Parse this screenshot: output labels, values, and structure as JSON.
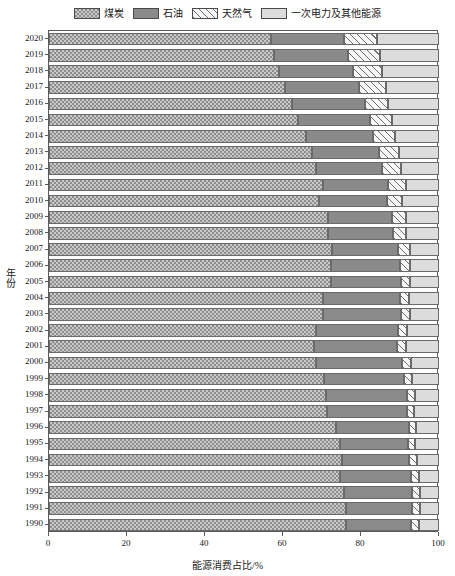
{
  "chart_data": {
    "type": "bar",
    "orientation": "horizontal",
    "stacked": true,
    "stack_total": 100,
    "title": "",
    "xlabel": "能源消费占比/%",
    "ylabel": "年份",
    "xlim": [
      0,
      100
    ],
    "xticks": [
      0,
      20,
      40,
      60,
      80,
      100
    ],
    "xtick_labels": [
      "0",
      "20",
      "40",
      "60",
      "80",
      "100"
    ],
    "grid": false,
    "legend_position": "top",
    "categories": [
      "2020",
      "2019",
      "2018",
      "2017",
      "2016",
      "2015",
      "2014",
      "2013",
      "2012",
      "2011",
      "2010",
      "2009",
      "2008",
      "2007",
      "2006",
      "2005",
      "2004",
      "2003",
      "2002",
      "2001",
      "2000",
      "1999",
      "1998",
      "1997",
      "1996",
      "1995",
      "1994",
      "1993",
      "1992",
      "1991",
      "1990"
    ],
    "series": [
      {
        "name": "煤炭",
        "pattern": "checker",
        "color": "#c9c9c9",
        "values": [
          56.8,
          57.7,
          59.0,
          60.6,
          62.2,
          63.8,
          65.8,
          67.4,
          68.5,
          70.2,
          69.2,
          71.6,
          71.5,
          72.5,
          72.4,
          72.4,
          70.2,
          70.2,
          68.5,
          68.0,
          68.5,
          70.6,
          70.9,
          71.4,
          73.5,
          74.6,
          75.0,
          74.7,
          75.7,
          76.1,
          76.2
        ]
      },
      {
        "name": "石油",
        "pattern": "solid",
        "color": "#8a8a8a",
        "values": [
          18.9,
          19.0,
          18.9,
          18.9,
          18.7,
          18.4,
          17.3,
          17.1,
          17.0,
          16.8,
          17.4,
          16.4,
          16.7,
          17.0,
          17.5,
          17.8,
          19.9,
          20.1,
          21.0,
          21.2,
          22.0,
          20.5,
          20.8,
          20.4,
          18.7,
          17.5,
          17.4,
          18.2,
          17.5,
          17.1,
          16.6
        ]
      },
      {
        "name": "天然气",
        "pattern": "hatch",
        "color": "#f2f2f2",
        "values": [
          8.4,
          8.1,
          7.6,
          6.9,
          6.1,
          5.8,
          5.6,
          5.3,
          4.8,
          4.6,
          4.0,
          3.5,
          3.4,
          3.0,
          2.7,
          2.4,
          2.3,
          2.3,
          2.4,
          2.4,
          2.2,
          2.1,
          2.1,
          1.8,
          1.8,
          1.8,
          1.9,
          1.9,
          1.9,
          2.0,
          2.1
        ]
      },
      {
        "name": "一次电力及其他能源",
        "pattern": "solid",
        "color": "#dcdcdc",
        "values": [
          15.9,
          15.2,
          14.5,
          13.6,
          13.0,
          12.0,
          11.3,
          10.2,
          9.7,
          8.4,
          9.4,
          8.5,
          8.4,
          7.5,
          7.4,
          7.4,
          7.6,
          7.4,
          8.1,
          8.4,
          7.3,
          6.8,
          6.2,
          6.4,
          6.0,
          6.1,
          5.7,
          5.2,
          4.9,
          4.8,
          5.1
        ]
      }
    ]
  },
  "legend": {
    "entries": [
      {
        "label": "煤炭"
      },
      {
        "label": "石油"
      },
      {
        "label": "天然气"
      },
      {
        "label": "一次电力及其他能源"
      }
    ]
  },
  "axes": {
    "x_title": "能源消费占比/%",
    "y_title": "年份"
  }
}
